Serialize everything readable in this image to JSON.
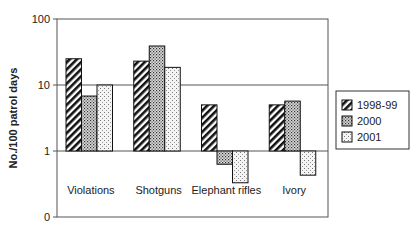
{
  "chart_data": {
    "type": "bar",
    "title": "",
    "xlabel": "",
    "ylabel": "No./100 patrol days",
    "yscale": "log",
    "ylim": [
      0.1,
      100
    ],
    "yticks": [
      {
        "label": "0",
        "value": 0.1
      },
      {
        "label": "1",
        "value": 1
      },
      {
        "label": "10",
        "value": 10
      },
      {
        "label": "100",
        "value": 100
      }
    ],
    "grid": "horizontal at 1, 10, 100",
    "baseline": 1,
    "categories": [
      "Violations",
      "Shotguns",
      "Elephant rifles",
      "Ivory"
    ],
    "series": [
      {
        "name": "1998-99",
        "pattern": "diagonal-hatch",
        "values": [
          25,
          23,
          5,
          5
        ]
      },
      {
        "name": "2000",
        "pattern": "dense-dots",
        "values": [
          6.8,
          39,
          0.63,
          5.7
        ]
      },
      {
        "name": "2001",
        "pattern": "sparse-dots",
        "values": [
          10,
          18.5,
          0.33,
          0.43
        ]
      }
    ],
    "legend_position": "right"
  }
}
